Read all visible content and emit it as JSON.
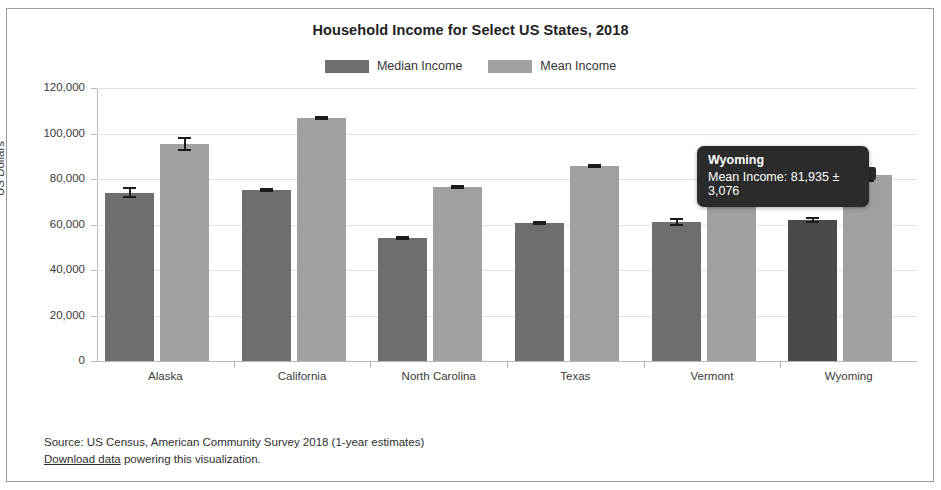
{
  "chart_data": {
    "type": "bar",
    "title": "Household Income for Select US States, 2018",
    "xlabel": "State",
    "ylabel": "US Dollars",
    "ylim": [
      0,
      120000
    ],
    "yticks": [
      "0",
      "20,000",
      "40,000",
      "60,000",
      "80,000",
      "100,000",
      "120,000"
    ],
    "ytick_values": [
      0,
      20000,
      40000,
      60000,
      80000,
      100000,
      120000
    ],
    "grid": true,
    "legend_position": "top-center",
    "categories": [
      "Alaska",
      "California",
      "North Carolina",
      "Texas",
      "Vermont",
      "Wyoming"
    ],
    "series": [
      {
        "name": "Median Income",
        "color": "#6e6e6e",
        "values": [
          74000,
          75300,
          53900,
          60600,
          61000,
          62000
        ],
        "errors": [
          2400,
          900,
          700,
          600,
          1700,
          1500
        ]
      },
      {
        "name": "Mean Income",
        "color": "#a0a0a0",
        "values": [
          95500,
          107000,
          76700,
          85600,
          82000,
          81935
        ],
        "errors": [
          3000,
          900,
          700,
          700,
          2600,
          3076
        ]
      }
    ],
    "annotations": [
      {
        "type": "tooltip",
        "category": "Wyoming",
        "series": "Mean Income",
        "title": "Wyoming",
        "text": "Mean Income: 81,935 ± 3,076",
        "value": 81935,
        "error": 3076
      }
    ]
  },
  "legend": {
    "items": [
      {
        "label": "Median Income",
        "color": "#6e6e6e"
      },
      {
        "label": "Mean Income",
        "color": "#a0a0a0"
      }
    ]
  },
  "tooltip": {
    "title": "Wyoming",
    "body": "Mean Income: 81,935 ± 3,076"
  },
  "footer": {
    "source": "Source: US Census, American Community Survey 2018 (1-year estimates)",
    "link_text": "Download data",
    "link_suffix": " powering this visualization."
  },
  "colors": {
    "median": "#6e6e6e",
    "mean": "#a0a0a0",
    "median_hover": "#4a4a4a",
    "tooltip_bg": "#2b2b2b",
    "grid": "#e2e2e2",
    "axis": "#b8b8b8"
  }
}
